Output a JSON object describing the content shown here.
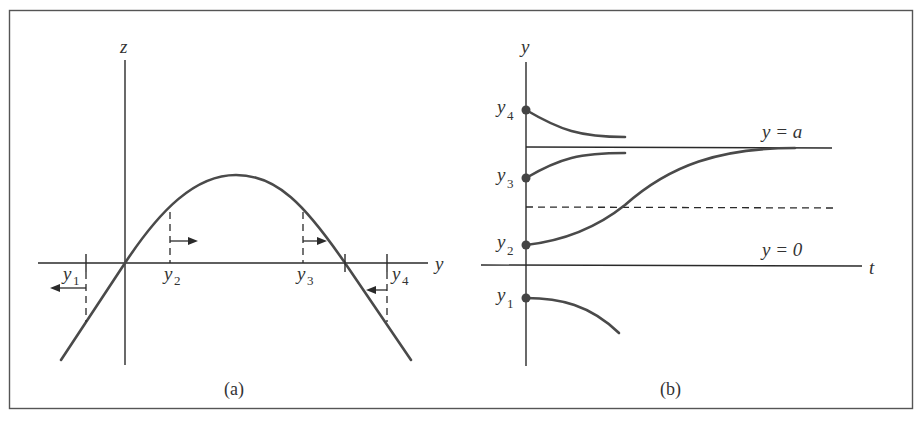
{
  "panel_a": {
    "caption": "(a)",
    "z_axis_label": "z",
    "y_axis_label": "y",
    "points": [
      {
        "name": "y",
        "sub": "1",
        "direction": "left"
      },
      {
        "name": "y",
        "sub": "2",
        "direction": "right"
      },
      {
        "name": "y",
        "sub": "3",
        "direction": "right"
      },
      {
        "name": "y",
        "sub": "4",
        "direction": "left"
      }
    ],
    "curve": "parabola-like hump z = f(y), zero at y = 0 and y = a"
  },
  "panel_b": {
    "caption": "(b)",
    "y_axis_label": "y",
    "t_axis_label": "t",
    "line_a_label": "y = a",
    "line_0_label": "y = 0",
    "initial_values": [
      {
        "name": "y",
        "sub": "4",
        "behavior": "decreases toward a"
      },
      {
        "name": "y",
        "sub": "3",
        "behavior": "increases toward a"
      },
      {
        "name": "y",
        "sub": "2",
        "behavior": "S-shaped increase toward a, inflection at dashed line a/2"
      },
      {
        "name": "y",
        "sub": "1",
        "behavior": "decreases away from 0"
      }
    ]
  },
  "colors": {
    "stroke": "#2a2a2a",
    "curve": "#4a4a4a",
    "frame": "#555555",
    "background": "#ffffff"
  }
}
